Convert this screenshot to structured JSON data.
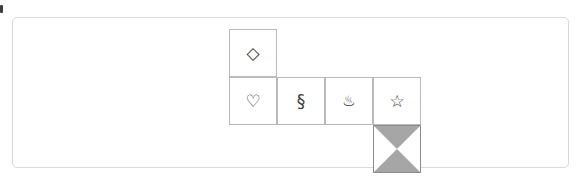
{
  "canvas": {
    "width": 584,
    "height": 185,
    "background": "#ffffff"
  },
  "panel": {
    "border_color": "#d9d9d9",
    "background": "#ffffff",
    "corner_radius": 5
  },
  "edge_marker": {
    "name": "clipped-edge-marker",
    "color": "#3c3c3c"
  },
  "board": {
    "cell_size": 48,
    "cell_border_color": "#b9b9b9",
    "cell_background": "#ffffff",
    "glyph_color": "#3a3a3a",
    "fill_gray": "#a6a6a6",
    "cells": [
      {
        "row": 0,
        "col": 0,
        "icon_name": "diamond-icon",
        "glyph": "◇",
        "label": "diamond"
      },
      {
        "row": 1,
        "col": 0,
        "icon_name": "white-heart-icon",
        "glyph": "♡",
        "label": "white heart"
      },
      {
        "row": 1,
        "col": 1,
        "icon_name": "section-sign-icon",
        "glyph": "§",
        "label": "section sign"
      },
      {
        "row": 1,
        "col": 2,
        "icon_name": "hot-springs-icon",
        "glyph": "♨",
        "label": "hot springs"
      },
      {
        "row": 1,
        "col": 3,
        "icon_name": "white-star-icon",
        "glyph": "☆",
        "label": "white star"
      },
      {
        "row": 2,
        "col": 3,
        "icon_name": "bowtie-fill-icon",
        "glyph": "",
        "label": "gray bowtie fill"
      }
    ]
  }
}
